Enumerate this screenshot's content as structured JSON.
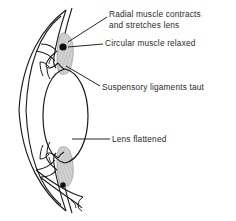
{
  "figure": {
    "kind": "eye-accommodation-diagram",
    "background_color": "#ffffff",
    "line_color": "#1a1a1a",
    "muscle_fill_color": "#c9c9c9",
    "text_color": "#2b2b2b"
  },
  "labels": {
    "radial_line1": "Radial muscle contracts",
    "radial_line2": "and stretches lens",
    "circular": "Circular muscle relaxed",
    "suspensory": "Suspensory ligaments taut",
    "lens": "Lens flattened"
  },
  "parts": {
    "cornea_sclera": "cornea-sclera-outline",
    "lens": "flattened-lens",
    "ciliary_muscle_top": "ciliary-muscle-top",
    "ciliary_muscle_bottom": "ciliary-muscle-bottom",
    "suspensory_ligament_top": "suspensory-ligament-top",
    "suspensory_ligament_bottom": "suspensory-ligament-bottom",
    "ciliary_dot_top": "ciliary-muscle-dot-top",
    "ciliary_dot_bottom": "ciliary-muscle-dot-bottom"
  }
}
